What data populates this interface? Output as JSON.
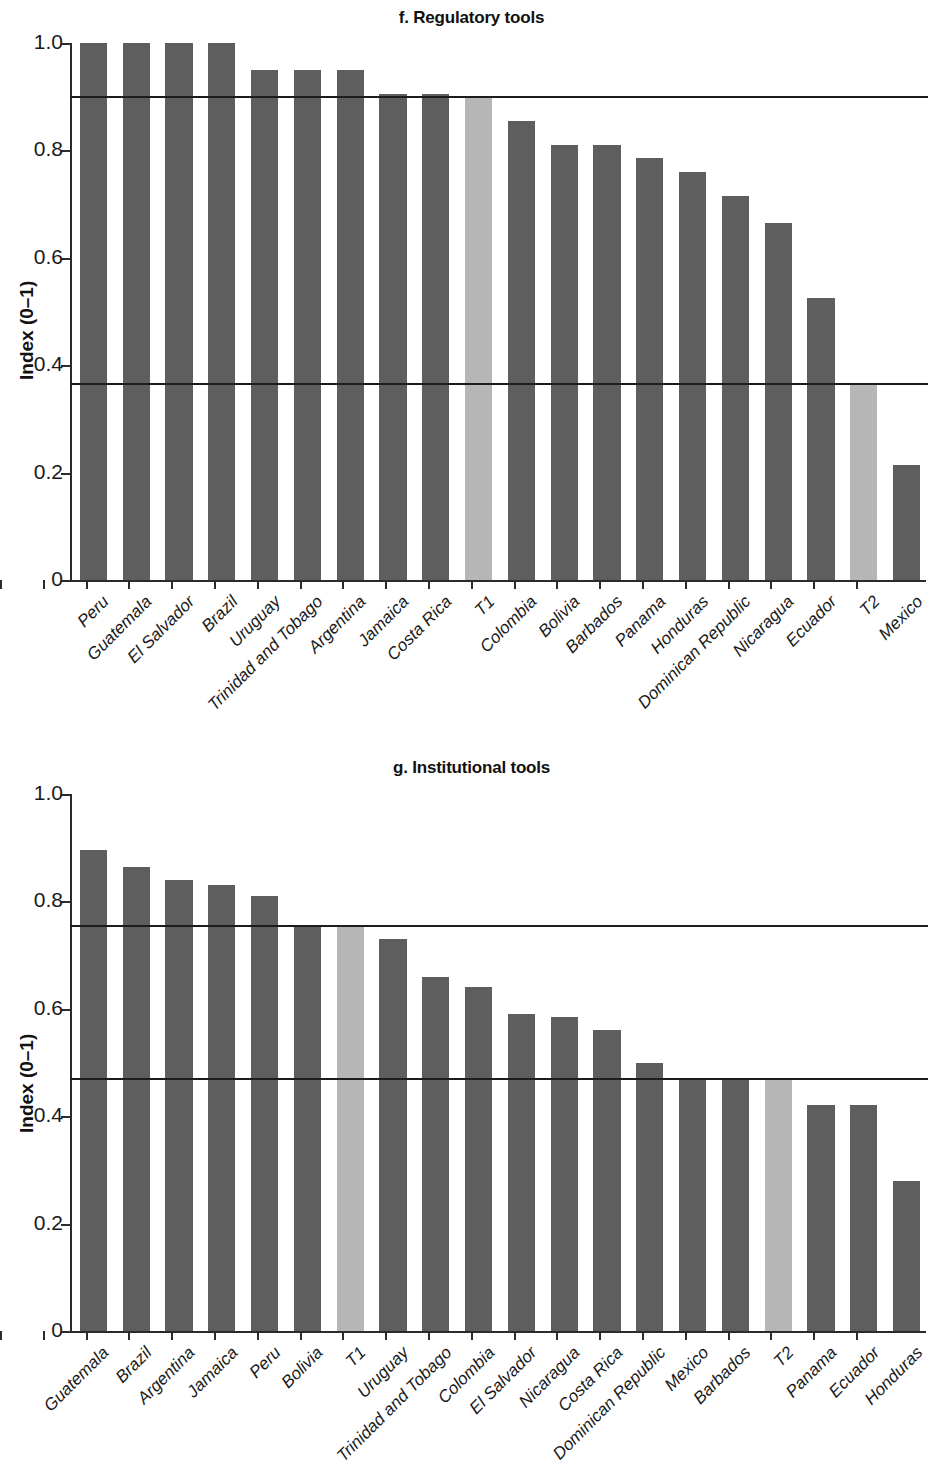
{
  "figure": {
    "axis_label_y": "Index (0–1)",
    "bar_color_dark": "#5e5e5e",
    "bar_color_light": "#b6b6b6",
    "refline_color": "#1c1c1c",
    "axis_color": "#2b2b2b"
  },
  "panels": [
    {
      "id": "f",
      "title": "f. Regulatory tools",
      "ylabel": "Index (0–1)",
      "yticks": [
        "0",
        "0.2",
        "0.4",
        "0.6",
        "0.8",
        "1.0"
      ]
    },
    {
      "id": "g",
      "title": "g. Institutional tools",
      "ylabel": "Index (0–1)",
      "yticks": [
        "0",
        "0.2",
        "0.4",
        "0.6",
        "0.8",
        "1.0"
      ]
    }
  ],
  "chart_data": [
    {
      "type": "bar",
      "title": "f. Regulatory tools",
      "xlabel": "",
      "ylabel": "Index (0–1)",
      "ylim": [
        0,
        1.0
      ],
      "ytick_values": [
        0,
        0.2,
        0.4,
        0.6,
        0.8,
        1.0
      ],
      "ytick_labels": [
        "0",
        "0.2",
        "0.4",
        "0.6",
        "0.8",
        "1.0"
      ],
      "grid": false,
      "legend": null,
      "categories": [
        "Peru",
        "Guatemala",
        "El Salvador",
        "Brazil",
        "Uruguay",
        "Trinidad and Tobago",
        "Argentina",
        "Jamaica",
        "Costa Rica",
        "T1",
        "Colombia",
        "Bolivia",
        "Barbados",
        "Panama",
        "Honduras",
        "Dominican Republic",
        "Nicaragua",
        "Ecuador",
        "T2",
        "Mexico"
      ],
      "values": [
        1.0,
        1.0,
        1.0,
        1.0,
        0.95,
        0.95,
        0.95,
        0.905,
        0.905,
        0.9,
        0.855,
        0.81,
        0.81,
        0.785,
        0.76,
        0.715,
        0.665,
        0.525,
        0.365,
        0.215
      ],
      "highlight_categories": [
        "T1",
        "T2"
      ],
      "reference_lines": [
        {
          "label": "T1",
          "value": 0.9
        },
        {
          "label": "T2",
          "value": 0.365
        }
      ]
    },
    {
      "type": "bar",
      "title": "g. Institutional tools",
      "xlabel": "",
      "ylabel": "Index (0–1)",
      "ylim": [
        0,
        1.0
      ],
      "ytick_values": [
        0,
        0.2,
        0.4,
        0.6,
        0.8,
        1.0
      ],
      "ytick_labels": [
        "0",
        "0.2",
        "0.4",
        "0.6",
        "0.8",
        "1.0"
      ],
      "grid": false,
      "legend": null,
      "categories": [
        "Guatemala",
        "Brazil",
        "Argentina",
        "Jamaica",
        "Peru",
        "Bolivia",
        "T1",
        "Uruguay",
        "Trinidad and Tobago",
        "Colombia",
        "El Salvador",
        "Nicaragua",
        "Costa Rica",
        "Dominican Republic",
        "Mexico",
        "Barbados",
        "T2",
        "Panama",
        "Ecuador",
        "Honduras"
      ],
      "values": [
        0.895,
        0.865,
        0.84,
        0.83,
        0.81,
        0.755,
        0.755,
        0.73,
        0.66,
        0.64,
        0.59,
        0.585,
        0.56,
        0.5,
        0.47,
        0.47,
        0.47,
        0.42,
        0.42,
        0.28
      ],
      "highlight_categories": [
        "T1",
        "T2"
      ],
      "reference_lines": [
        {
          "label": "T1",
          "value": 0.755
        },
        {
          "label": "T2",
          "value": 0.47
        }
      ]
    }
  ]
}
